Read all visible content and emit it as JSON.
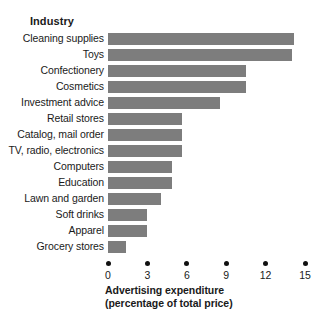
{
  "chart_data": {
    "type": "bar",
    "orientation": "horizontal",
    "title": "",
    "xlabel": "Advertising expenditure (percentage of total price)",
    "xlabel_line1": "Advertising expenditure",
    "xlabel_line2": "(percentage of total price)",
    "ylabel": "Industry",
    "xlim": [
      0,
      15
    ],
    "xticks": [
      0,
      3,
      6,
      9,
      12,
      15
    ],
    "xtick_labels": [
      "0",
      "3",
      "6",
      "9",
      "12",
      "15"
    ],
    "grid": false,
    "legend": null,
    "bar_color": "#7d7d7d",
    "categories": [
      "Cleaning supplies",
      "Toys",
      "Confectionery",
      "Cosmetics",
      "Investment advice",
      "Retail stores",
      "Catalog, mail order",
      "TV, radio, electronics",
      "Computers",
      "Education",
      "Lawn and garden",
      "Soft drinks",
      "Apparel",
      "Grocery stores"
    ],
    "values": [
      14.2,
      14.0,
      10.5,
      10.5,
      8.5,
      5.6,
      5.6,
      5.6,
      4.9,
      4.9,
      4.0,
      3.0,
      3.0,
      1.4
    ]
  }
}
